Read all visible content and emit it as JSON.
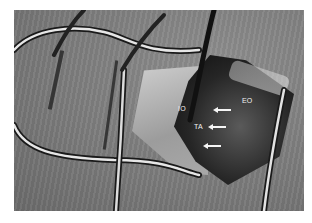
{
  "image": {
    "description": "Grayscale intraoperative surgical photograph of an abdominal wall incision held open by retractors, with muscle layers labeled",
    "colors": {
      "label_text": "#f2f2f2",
      "arrow": "#f5f5f5",
      "border": "#ffffff"
    }
  },
  "labels": [
    {
      "id": "io",
      "text": "IO"
    },
    {
      "id": "eo",
      "text": "EO"
    },
    {
      "id": "ta",
      "text": "TA"
    }
  ],
  "arrows": [
    {
      "direction": "left"
    },
    {
      "direction": "left"
    },
    {
      "direction": "left"
    }
  ]
}
